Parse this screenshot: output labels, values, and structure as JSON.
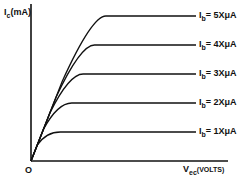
{
  "chart_data": {
    "type": "line",
    "title": "",
    "xlabel": "V_ec (VOLTS)",
    "ylabel": "I_c (mA)",
    "origin_label": "O",
    "grid": false,
    "legend_position": "inline-right",
    "series": [
      {
        "name": "I_b = 5XμA",
        "label_main": "I",
        "label_sub": "b",
        "label_rest": "= 5XμA",
        "plateau": 5
      },
      {
        "name": "I_b = 4XμA",
        "label_main": "I",
        "label_sub": "b",
        "label_rest": "= 4XμA",
        "plateau": 4
      },
      {
        "name": "I_b = 3XμA",
        "label_main": "I",
        "label_sub": "b",
        "label_rest": "= 3XμA",
        "plateau": 3
      },
      {
        "name": "I_b = 2XμA",
        "label_main": "I",
        "label_sub": "b",
        "label_rest": "= 2XμA",
        "plateau": 2
      },
      {
        "name": "I_b = 1XμA",
        "label_main": "I",
        "label_sub": "b",
        "label_rest": "= 1XμA",
        "plateau": 1
      }
    ]
  },
  "axes": {
    "y_main": "I",
    "y_sub": "c",
    "y_rest": "(mA)",
    "x_main": "V",
    "x_sub": "ec",
    "x_rest": "(VOLTS)",
    "origin": "O"
  }
}
